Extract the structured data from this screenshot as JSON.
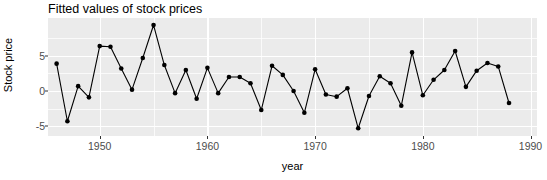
{
  "chart_data": {
    "type": "line",
    "title": "Fitted values of stock prices",
    "xlabel": "year",
    "ylabel": "Stock price",
    "grid": true,
    "legend": null,
    "xlim": [
      1945.2,
      1990.6
    ],
    "ylim": [
      -6.4,
      10.4
    ],
    "x_ticks": [
      1950,
      1960,
      1970,
      1980,
      1990
    ],
    "x_tick_labels": [
      "1950",
      "1960",
      "1970",
      "1980",
      "1990"
    ],
    "y_ticks": [
      -5,
      0,
      5
    ],
    "y_tick_labels": [
      "-5",
      "0",
      "5"
    ],
    "marker": "filled-circle",
    "series": [
      {
        "name": "fitted stock price",
        "color": "#000000",
        "x": [
          1946,
          1947,
          1948,
          1949,
          1950,
          1951,
          1952,
          1953,
          1954,
          1955,
          1956,
          1957,
          1958,
          1959,
          1960,
          1961,
          1962,
          1963,
          1964,
          1965,
          1966,
          1967,
          1968,
          1969,
          1970,
          1971,
          1972,
          1973,
          1974,
          1975,
          1976,
          1977,
          1978,
          1979,
          1980,
          1981,
          1982,
          1983,
          1984,
          1985,
          1986,
          1987,
          1988
        ],
        "values": [
          3.9,
          -4.3,
          0.7,
          -0.9,
          6.4,
          6.3,
          3.2,
          0.2,
          4.7,
          9.4,
          3.7,
          -0.3,
          3.0,
          -1.1,
          3.3,
          -0.3,
          2.0,
          2.0,
          1.1,
          -2.7,
          3.6,
          2.3,
          0.0,
          -3.1,
          3.1,
          -0.5,
          -0.8,
          0.4,
          -5.3,
          -0.7,
          2.1,
          1.1,
          -2.1,
          5.5,
          -0.6,
          1.6,
          3.0,
          5.7,
          0.6,
          2.9,
          4.0,
          3.5,
          -1.7
        ]
      }
    ]
  }
}
